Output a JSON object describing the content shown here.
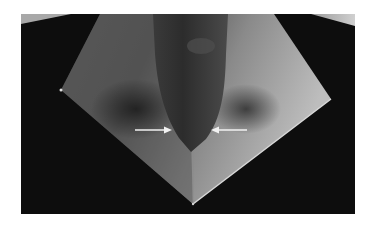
{
  "figure": {
    "alt_text": "V-bend forming with punch; arrows indicate contact points near punch tip",
    "colors": {
      "page_background": "#ffffff",
      "photo_background": "#0d0d0d",
      "sheet_light": "#b8b8b8",
      "sheet_mid": "#6e6e6e",
      "punch": "#3a3a3a",
      "arrow": "#f2f2f2"
    },
    "annotations": [
      {
        "type": "arrow",
        "direction": "right",
        "label": "left-arrow"
      },
      {
        "type": "arrow",
        "direction": "left",
        "label": "right-arrow"
      }
    ]
  }
}
